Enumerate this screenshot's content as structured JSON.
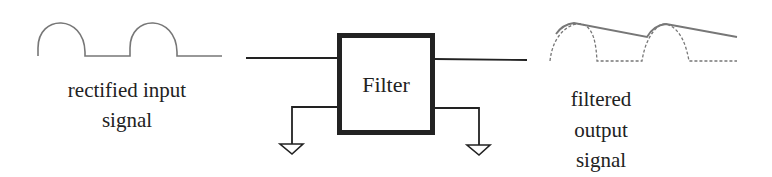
{
  "diagram": {
    "type": "signal-filter-block-diagram",
    "block": {
      "label": "Filter"
    },
    "input": {
      "label_line1": "rectified input",
      "label_line2": "signal"
    },
    "output": {
      "label_line1": "filtered",
      "label_line2": "output",
      "label_line3": "signal"
    },
    "ground_symbols": 2,
    "colors": {
      "stroke": "#222222",
      "waveform": "#777777",
      "background": "#ffffff"
    }
  }
}
